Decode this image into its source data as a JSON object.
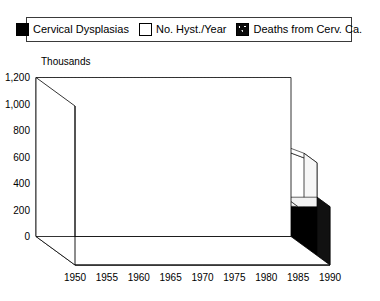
{
  "legend": {
    "entries": [
      {
        "label": "Cervical Dysplasias",
        "swatch": "solid-black-square-icon",
        "color": "#000000"
      },
      {
        "label": "No. Hyst./Year",
        "swatch": "open-white-square-icon",
        "color": "#ffffff"
      },
      {
        "label": "Deaths from Cerv. Ca.",
        "swatch": "speckled-dark-square-icon",
        "color": "#111111"
      }
    ]
  },
  "chart_data": {
    "type": "area",
    "title": "",
    "unit_title": "Thousands",
    "xlabel": "",
    "ylabel": "Thousands",
    "grid": true,
    "legend_position": "top",
    "projection": "3d-stacked-ribbon",
    "xlim": [
      1950,
      1990
    ],
    "ylim": [
      0,
      1200
    ],
    "ytick_labels": [
      "0",
      "200",
      "400",
      "600",
      "800",
      "1,000",
      "1,200"
    ],
    "yticks": [
      0,
      200,
      400,
      600,
      800,
      1000,
      1200
    ],
    "xtick_labels": [
      "1950",
      "1955",
      "1960",
      "1965",
      "1970",
      "1975",
      "1980",
      "1985",
      "1990"
    ],
    "xticks": [
      1950,
      1955,
      1960,
      1965,
      1970,
      1975,
      1980,
      1985,
      1990
    ],
    "x": [
      1950,
      1955,
      1960,
      1965,
      1970,
      1975,
      1980,
      1985,
      1990
    ],
    "series": [
      {
        "name": "Cervical Dysplasias",
        "color": "#000000",
        "values": [
          900,
          840,
          780,
          700,
          610,
          520,
          455,
          440,
          440
        ]
      },
      {
        "name": "No. Hyst./Year",
        "color": "#ffffff",
        "values": [
          520,
          545,
          580,
          620,
          700,
          960,
          1090,
          790,
          700
        ]
      },
      {
        "name": "Deaths from Cerv. Ca.",
        "color": "#111111",
        "values": [
          100,
          105,
          110,
          118,
          130,
          150,
          190,
          300,
          430
        ]
      }
    ]
  }
}
